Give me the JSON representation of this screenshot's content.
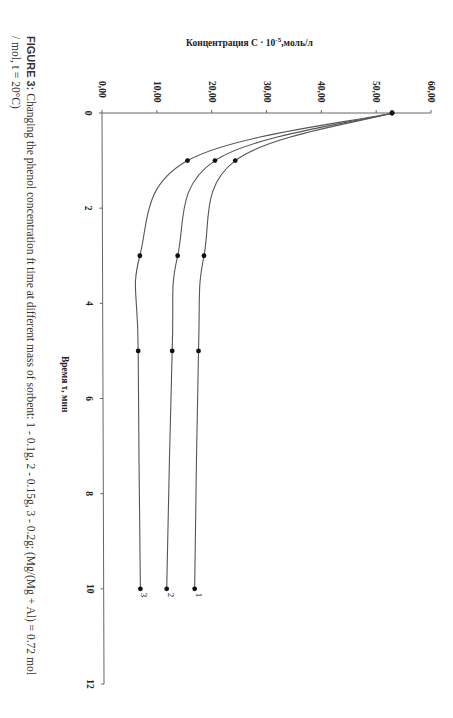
{
  "chart_data": {
    "type": "line",
    "title": "",
    "xlabel": "Время τ, мин",
    "ylabel": "Концентрация C · 10⁻⁵, моль/л",
    "ylabel_main": "Концентрация C · 10",
    "ylabel_exp": "-5",
    "ylabel_unit": ",моль/л",
    "xlim": [
      0,
      12
    ],
    "ylim": [
      0,
      60
    ],
    "x_ticks": [
      "0",
      "2",
      "4",
      "6",
      "8",
      "10",
      "12"
    ],
    "y_ticks": [
      "0,00",
      "10,00",
      "20,00",
      "30,00",
      "40,00",
      "50,00",
      "60,00"
    ],
    "grid": false,
    "legend": "inline labels at line ends",
    "orientation": "rotated 90° clockwise on page",
    "x": [
      0,
      1,
      3,
      5,
      10
    ],
    "series": [
      {
        "name": "1",
        "description": "0.1g sorbent",
        "values": [
          52.9,
          24.3,
          18.6,
          17.6,
          16.9
        ]
      },
      {
        "name": "2",
        "description": "0.15g sorbent",
        "values": [
          52.9,
          20.6,
          13.8,
          12.8,
          11.8
        ]
      },
      {
        "name": "3",
        "description": "0.2g sorbent",
        "values": [
          52.9,
          15.6,
          6.9,
          6.6,
          7.0
        ]
      }
    ]
  },
  "caption": {
    "label": "FIGURE 3:",
    "line1": " Changing the phenol concentration ft time at different mass of sorbent: 1 - 0.1g, 2 - 0.15g, 3 - 0.2g; (Mg/(Mg + Al) = 0.72 mol",
    "line2": "/ mol, t = 20°C)"
  },
  "colors": {
    "line": "#555555",
    "marker": "#111111",
    "axis": "#666666",
    "text": "#222222"
  }
}
